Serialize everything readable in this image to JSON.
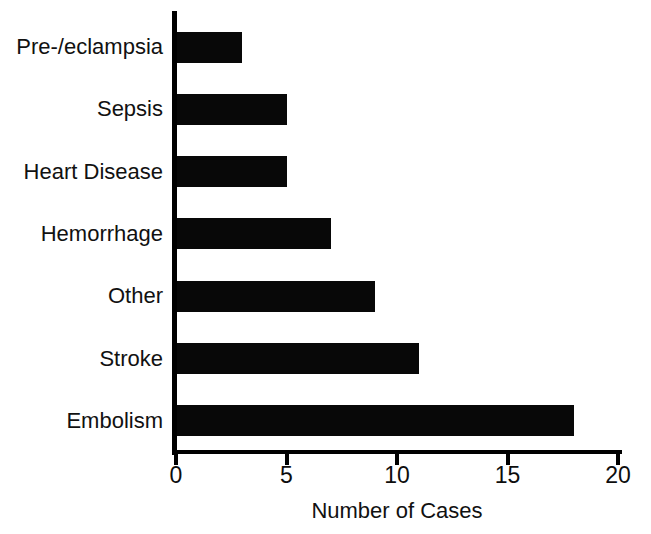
{
  "chart_data": {
    "type": "bar",
    "orientation": "horizontal",
    "title": "",
    "subtitle": "",
    "xlabel": "Number of Cases",
    "ylabel": "",
    "categories": [
      "Embolism",
      "Stroke",
      "Other",
      "Hemorrhage",
      "Heart Disease",
      "Sepsis",
      "Pre-/eclampsia"
    ],
    "values": [
      18,
      11,
      9,
      7,
      5,
      5,
      3
    ],
    "series": [
      {
        "name": "Number of Cases",
        "values": [
          18,
          11,
          9,
          7,
          5,
          5,
          3
        ]
      }
    ],
    "bars_top_to_bottom": [
      {
        "category": "Pre-/eclampsia",
        "value": 3
      },
      {
        "category": "Sepsis",
        "value": 5
      },
      {
        "category": "Heart Disease",
        "value": 5
      },
      {
        "category": "Hemorrhage",
        "value": 7
      },
      {
        "category": "Other",
        "value": 9
      },
      {
        "category": "Stroke",
        "value": 11
      },
      {
        "category": "Embolism",
        "value": 18
      }
    ],
    "xlim": [
      0,
      20
    ],
    "xticks": [
      0,
      5,
      10,
      15,
      20
    ],
    "xtick_labels": [
      "0",
      "5",
      "10",
      "15",
      "20"
    ],
    "grid": false,
    "legend": false,
    "legend_position": "none",
    "bar_color": "#080808",
    "background_color": "#ffffff",
    "axis_color": "#000000"
  },
  "axis": {
    "x_title": "Number of Cases",
    "tick_0": "0",
    "tick_1": "5",
    "tick_2": "10",
    "tick_3": "15",
    "tick_4": "20"
  },
  "labels": {
    "cat_0": "Pre-/eclampsia",
    "cat_1": "Sepsis",
    "cat_2": "Heart Disease",
    "cat_3": "Hemorrhage",
    "cat_4": "Other",
    "cat_5": "Stroke",
    "cat_6": "Embolism"
  }
}
